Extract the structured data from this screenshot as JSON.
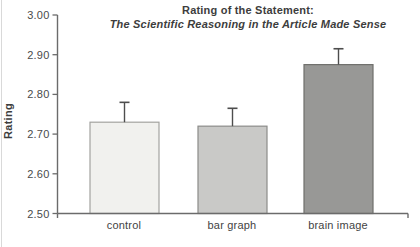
{
  "chart_data": {
    "type": "bar",
    "title_line1": "Rating of the Statement:",
    "title_line2": "The Scientific Reasoning in the Article Made Sense",
    "ylabel": "Rating",
    "xlabel": "",
    "categories": [
      "control",
      "bar graph",
      "brain image"
    ],
    "values": [
      2.73,
      2.72,
      2.875
    ],
    "errors_up": [
      0.05,
      0.045,
      0.04
    ],
    "ylim": [
      2.5,
      3.0
    ],
    "y_tick_labels": [
      "3.00",
      "2.90",
      "2.80",
      "2.70",
      "2.60",
      "2.50"
    ],
    "y_tick_values": [
      3.0,
      2.9,
      2.8,
      2.7,
      2.6,
      2.5
    ],
    "grid": false,
    "legend": "none",
    "colors": {
      "bar_fills": [
        "#f1f1ee",
        "#c9c9c7",
        "#989896"
      ],
      "bar_borders": [
        "#a3a3a0",
        "#8c8c89",
        "#6f6f6c"
      ],
      "error_bar": "#4d4d4d",
      "axis": "#6b6b6b",
      "text": "#3d3d3d",
      "tick_label": "#4a4a4a",
      "background": "#ffffff"
    }
  }
}
